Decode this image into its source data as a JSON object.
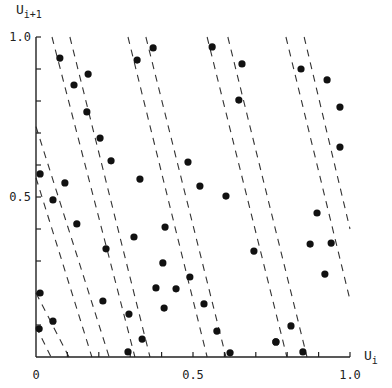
{
  "chart_data": {
    "type": "scatter",
    "title": "",
    "xlabel": "U",
    "xlabel_sub": "i",
    "ylabel": "U",
    "ylabel_sub": "i+1",
    "xlim": [
      0,
      1
    ],
    "ylim": [
      0,
      1
    ],
    "grid": false,
    "legend": null,
    "x_tick_labels": [
      "0",
      "0.5",
      "1.0"
    ],
    "y_tick_labels": [
      "0.5",
      "1.0"
    ],
    "minor_tick_step": 0.1,
    "points": [
      [
        0.076,
        0.934
      ],
      [
        0.166,
        0.884
      ],
      [
        0.121,
        0.85
      ],
      [
        0.162,
        0.766
      ],
      [
        0.204,
        0.684
      ],
      [
        0.239,
        0.613
      ],
      [
        0.013,
        0.572
      ],
      [
        0.092,
        0.544
      ],
      [
        0.331,
        0.556
      ],
      [
        0.322,
        0.928
      ],
      [
        0.373,
        0.966
      ],
      [
        0.054,
        0.491
      ],
      [
        0.13,
        0.416
      ],
      [
        0.312,
        0.375
      ],
      [
        0.223,
        0.338
      ],
      [
        0.382,
        0.216
      ],
      [
        0.013,
        0.2
      ],
      [
        0.213,
        0.175
      ],
      [
        0.296,
        0.134
      ],
      [
        0.054,
        0.112
      ],
      [
        0.01,
        0.088
      ],
      [
        0.338,
        0.056
      ],
      [
        0.293,
        0.016
      ],
      [
        0.561,
        0.969
      ],
      [
        0.656,
        0.916
      ],
      [
        0.646,
        0.803
      ],
      [
        0.484,
        0.609
      ],
      [
        0.522,
        0.534
      ],
      [
        0.605,
        0.503
      ],
      [
        0.411,
        0.406
      ],
      [
        0.694,
        0.331
      ],
      [
        0.404,
        0.294
      ],
      [
        0.49,
        0.25
      ],
      [
        0.446,
        0.213
      ],
      [
        0.535,
        0.166
      ],
      [
        0.576,
        0.081
      ],
      [
        0.764,
        0.047
      ],
      [
        0.618,
        0.013
      ],
      [
        0.844,
        0.9
      ],
      [
        0.927,
        0.866
      ],
      [
        0.968,
        0.781
      ],
      [
        0.968,
        0.656
      ],
      [
        0.895,
        0.45
      ],
      [
        0.873,
        0.353
      ],
      [
        0.94,
        0.356
      ],
      [
        0.92,
        0.259
      ],
      [
        0.812,
        0.097
      ],
      [
        0.764,
        0.047
      ],
      [
        0.85,
        0.016
      ],
      [
        0.408,
        0.153
      ]
    ],
    "dashed_lines": [
      {
        "x0": 0.051,
        "y0": 1.0,
        "x1": 0.315,
        "y1": 0.0
      },
      {
        "x0": 0.108,
        "y0": 1.0,
        "x1": 0.363,
        "y1": 0.0
      },
      {
        "x0": 0.293,
        "y0": 1.0,
        "x1": 0.545,
        "y1": 0.0
      },
      {
        "x0": 0.35,
        "y0": 1.0,
        "x1": 0.605,
        "y1": 0.0
      },
      {
        "x0": 0.545,
        "y0": 1.0,
        "x1": 0.799,
        "y1": 0.0
      },
      {
        "x0": 0.611,
        "y0": 1.0,
        "x1": 0.863,
        "y1": 0.0
      },
      {
        "x0": 0.796,
        "y0": 1.0,
        "x1": 1.0,
        "y1": 0.178
      },
      {
        "x0": 0.854,
        "y0": 1.0,
        "x1": 1.0,
        "y1": 0.4
      },
      {
        "x0": 0.0,
        "y0": 0.72,
        "x1": 0.233,
        "y1": 0.0
      },
      {
        "x0": 0.0,
        "y0": 0.56,
        "x1": 0.178,
        "y1": 0.0
      },
      {
        "x0": 0.0,
        "y0": 0.2,
        "x1": 0.105,
        "y1": 0.0
      },
      {
        "x0": 0.0,
        "y0": 0.095,
        "x1": 0.048,
        "y1": 0.0
      }
    ]
  }
}
